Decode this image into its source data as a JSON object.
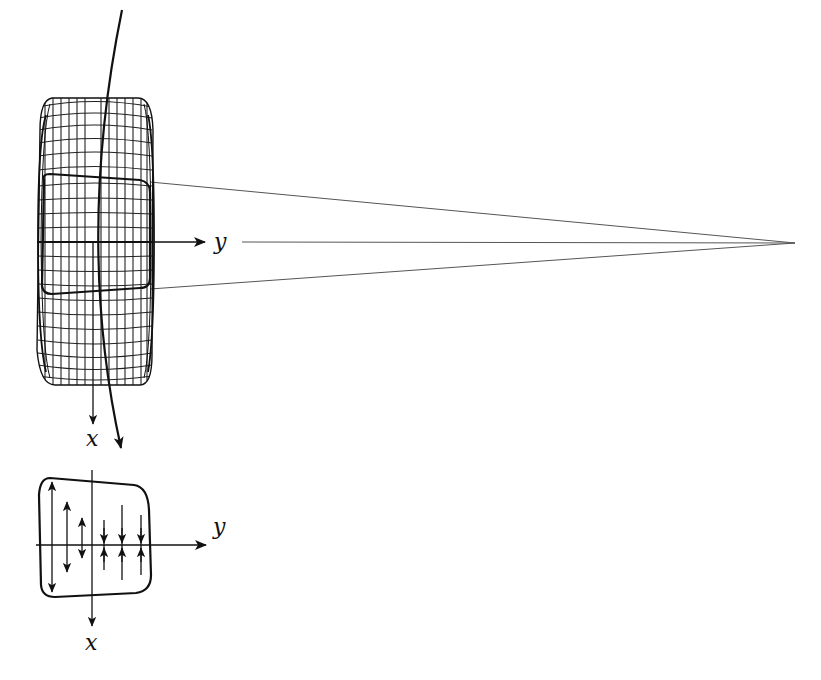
{
  "figure": {
    "colors": {
      "stroke": "#111111",
      "mesh": "#222222",
      "thin_line": "#555555",
      "background": "#ffffff"
    }
  },
  "upper_view": {
    "axis_x_label": "x",
    "axis_y_label": "y",
    "mesh": {
      "left": 37,
      "right": 152,
      "top": 97,
      "bottom": 385,
      "vertical_lines": 14,
      "horizontal_lines": 21
    },
    "perspective_apex": [
      795,
      243
    ]
  },
  "lower_view": {
    "axis_x_label": "x",
    "axis_y_label": "y",
    "arrows": [
      {
        "x": 52,
        "y1": 483,
        "y2": 591,
        "direction": "outward"
      },
      {
        "x": 67,
        "y1": 502,
        "y2": 570,
        "direction": "outward"
      },
      {
        "x": 82,
        "y1": 518,
        "y2": 557,
        "direction": "outward"
      },
      {
        "x": 104,
        "y1": 520,
        "y2": 570,
        "direction": "inward"
      },
      {
        "x": 122,
        "y1": 505,
        "y2": 580,
        "direction": "inward"
      },
      {
        "x": 141,
        "y1": 515,
        "y2": 575,
        "direction": "inward"
      }
    ]
  }
}
